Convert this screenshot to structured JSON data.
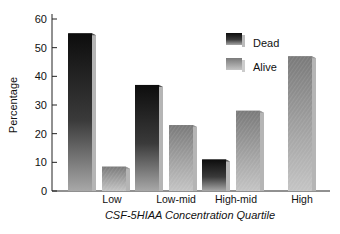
{
  "chart_data": {
    "type": "bar",
    "title": "",
    "xlabel": "CSF-5HIAA Concentration Quartile",
    "ylabel": "Percentage",
    "ylim": [
      0,
      60
    ],
    "yticks": [
      0,
      10,
      20,
      30,
      40,
      50,
      60
    ],
    "grid": false,
    "legend_position": "upper right, inside plot",
    "categories": [
      "Low",
      "Low-mid",
      "High-mid",
      "High"
    ],
    "series": [
      {
        "name": "Dead",
        "values": [
          55,
          37,
          11,
          null
        ],
        "color": "#1a1a1a"
      },
      {
        "name": "Alive",
        "values": [
          8.5,
          23,
          28,
          47
        ],
        "color": "#9a9a9a"
      }
    ]
  },
  "legend": {
    "items": [
      {
        "label": "Dead"
      },
      {
        "label": "Alive"
      }
    ]
  },
  "axes": {
    "y_title": "Percentage",
    "x_title": "CSF-5HIAA Concentration Quartile",
    "y_tick_labels": [
      "0",
      "10",
      "20",
      "30",
      "40",
      "50",
      "60"
    ],
    "x_tick_labels": [
      "Low",
      "Low-mid",
      "High-mid",
      "High"
    ]
  }
}
